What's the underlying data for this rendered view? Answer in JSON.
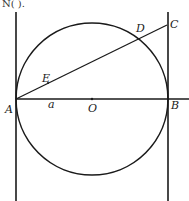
{
  "header_fragment": "N(      ).",
  "diagram": {
    "type": "geometry",
    "points": {
      "A": {
        "label": "A"
      },
      "B": {
        "label": "B"
      },
      "C": {
        "label": "C"
      },
      "D": {
        "label": "D"
      },
      "E": {
        "label": "E"
      },
      "O": {
        "label": "O"
      }
    },
    "segment_label": "a",
    "stroke_color": "#1a1a1a",
    "background": "#ffffff"
  }
}
